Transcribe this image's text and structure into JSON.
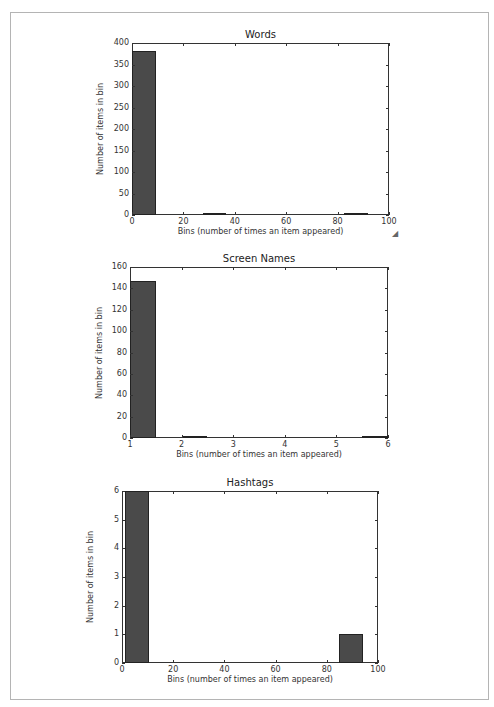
{
  "chart_data": [
    {
      "type": "bar",
      "title": "Words",
      "xlabel": "Bins (number of times an item appeared)",
      "ylabel": "Number of items in bin",
      "xlim": [
        0,
        100
      ],
      "ylim": [
        0,
        400
      ],
      "xticks": [
        "0",
        "20",
        "40",
        "60",
        "80",
        "100"
      ],
      "yticks": [
        "0",
        "50",
        "100",
        "150",
        "200",
        "250",
        "300",
        "350",
        "400"
      ],
      "bins": [
        {
          "x0": 0,
          "x1": 9.2,
          "value": 381
        },
        {
          "x0": 27.5,
          "x1": 36.7,
          "value": 1
        },
        {
          "x0": 82.6,
          "x1": 91.8,
          "value": 1
        }
      ],
      "grid": false
    },
    {
      "type": "bar",
      "title": "Screen Names",
      "xlabel": "Bins (number of times an item appeared)",
      "ylabel": "Number of items in bin",
      "xlim": [
        1,
        6
      ],
      "ylim": [
        0,
        160
      ],
      "xticks": [
        "1",
        "2",
        "3",
        "4",
        "5",
        "6"
      ],
      "yticks": [
        "0",
        "20",
        "40",
        "60",
        "80",
        "100",
        "120",
        "140",
        "160"
      ],
      "bins": [
        {
          "x0": 1.0,
          "x1": 1.5,
          "value": 147
        },
        {
          "x0": 2.0,
          "x1": 2.5,
          "value": 2
        },
        {
          "x0": 5.5,
          "x1": 6.0,
          "value": 1
        }
      ],
      "grid": false
    },
    {
      "type": "bar",
      "title": "Hashtags",
      "xlabel": "Bins (number of times an item appeared)",
      "ylabel": "Number of items in bin",
      "xlim": [
        0,
        100
      ],
      "ylim": [
        0,
        6
      ],
      "xticks": [
        "0",
        "20",
        "40",
        "60",
        "80",
        "100"
      ],
      "yticks": [
        "0",
        "1",
        "2",
        "3",
        "4",
        "5",
        "6"
      ],
      "bins": [
        {
          "x0": 1,
          "x1": 10.4,
          "value": 6
        },
        {
          "x0": 84.6,
          "x1": 94,
          "value": 1
        }
      ],
      "grid": false
    }
  ],
  "colors": {
    "bar_fill": "#4a4a4a",
    "bar_edge": "#222222",
    "axes": "#333333",
    "frame": "#b4b4b4"
  }
}
